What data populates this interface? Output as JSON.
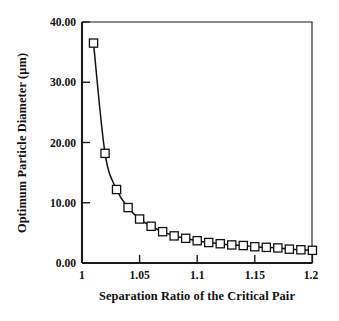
{
  "chart_data": {
    "type": "line",
    "title": "",
    "xlabel": "Separation Ratio of the Critical Pair",
    "ylabel": "Optimum Particle Diameter (µm)",
    "xlim": [
      1,
      1.2
    ],
    "ylim": [
      0,
      40
    ],
    "grid": false,
    "legend": null,
    "marker": "open-square",
    "x_tick_labels": [
      "1",
      "1.05",
      "1.1",
      "1.15",
      "1.2"
    ],
    "x_tick_values": [
      1,
      1.05,
      1.1,
      1.15,
      1.2
    ],
    "y_tick_labels": [
      "0.00",
      "10.00",
      "20.00",
      "30.00",
      "40.00"
    ],
    "y_tick_values": [
      0,
      10,
      20,
      30,
      40
    ],
    "x": [
      1.01,
      1.02,
      1.03,
      1.04,
      1.05,
      1.06,
      1.07,
      1.08,
      1.09,
      1.1,
      1.11,
      1.12,
      1.13,
      1.14,
      1.15,
      1.16,
      1.17,
      1.18,
      1.19,
      1.2
    ],
    "values": [
      36.5,
      18.2,
      12.2,
      9.2,
      7.3,
      6.1,
      5.2,
      4.5,
      4.1,
      3.7,
      3.4,
      3.2,
      3.0,
      2.9,
      2.7,
      2.6,
      2.5,
      2.3,
      2.2,
      2.1
    ],
    "series": [
      {
        "name": "Optimum Particle Diameter",
        "values": [
          36.5,
          18.2,
          12.2,
          9.2,
          7.3,
          6.1,
          5.2,
          4.5,
          4.1,
          3.7,
          3.4,
          3.2,
          3.0,
          2.9,
          2.7,
          2.6,
          2.5,
          2.3,
          2.2,
          2.1
        ]
      }
    ],
    "line_color": "#111111",
    "marker_face_color": "#ffffff",
    "marker_edge_color": "#111111",
    "background_color": "#ffffff"
  }
}
